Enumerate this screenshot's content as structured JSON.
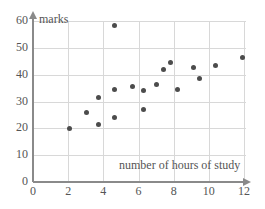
{
  "chart_data": {
    "type": "scatter",
    "title": "",
    "xlabel": "number of hours of study",
    "ylabel": "marks",
    "xlim": [
      0,
      12
    ],
    "ylim": [
      0,
      60
    ],
    "xticks": [
      0,
      2,
      4,
      6,
      8,
      10,
      12
    ],
    "yticks": [
      0,
      10,
      20,
      30,
      40,
      50,
      60
    ],
    "xtick_labels": [
      "0",
      "2",
      "4",
      "6",
      "8",
      "10",
      "12"
    ],
    "ytick_labels": [
      "0",
      "10",
      "20",
      "30",
      "40",
      "50",
      "60"
    ],
    "grid": true,
    "legend": null,
    "marker": "filled-circle",
    "marker_color": "#4c4c4c",
    "points": [
      {
        "x": 2.05,
        "y": 20.0
      },
      {
        "x": 3.05,
        "y": 26.0
      },
      {
        "x": 3.75,
        "y": 31.5
      },
      {
        "x": 3.75,
        "y": 21.5
      },
      {
        "x": 4.65,
        "y": 58.5
      },
      {
        "x": 4.65,
        "y": 34.5
      },
      {
        "x": 4.65,
        "y": 24.0
      },
      {
        "x": 5.65,
        "y": 35.5
      },
      {
        "x": 6.3,
        "y": 34.0
      },
      {
        "x": 6.3,
        "y": 27.0
      },
      {
        "x": 7.05,
        "y": 36.5
      },
      {
        "x": 7.45,
        "y": 42.0
      },
      {
        "x": 7.8,
        "y": 44.5
      },
      {
        "x": 8.2,
        "y": 34.5
      },
      {
        "x": 9.15,
        "y": 42.5
      },
      {
        "x": 9.45,
        "y": 38.5
      },
      {
        "x": 10.4,
        "y": 43.5
      },
      {
        "x": 11.9,
        "y": 46.5
      }
    ]
  }
}
